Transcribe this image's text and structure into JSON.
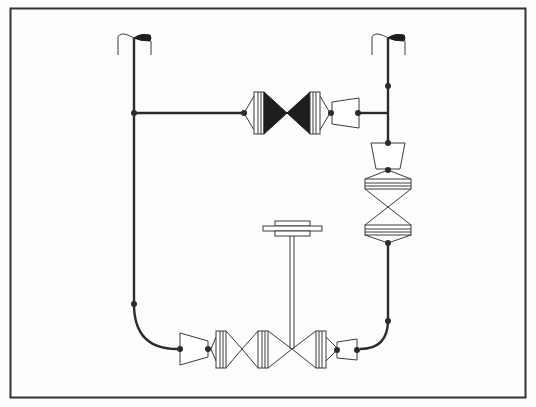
{
  "diagram": {
    "title": "",
    "type": "mechanical schematic",
    "colors": {
      "line": "#2b2b2b",
      "fill": "#ffffff",
      "solid": "#1e1e1e",
      "frame": "#333333"
    },
    "frame": {
      "x": 10,
      "y": 8,
      "w": 516,
      "h": 390
    },
    "vents": [
      {
        "id": "vent-left",
        "x": 133,
        "y": 38
      },
      {
        "id": "vent-right",
        "x": 388,
        "y": 38
      }
    ],
    "components": [
      {
        "id": "upper-valve-pair",
        "kind": "double cone valve (filled)",
        "cx": 274,
        "cy": 113
      },
      {
        "id": "upper-reducer",
        "kind": "reducer",
        "cx": 342,
        "cy": 113
      },
      {
        "id": "right-reducer",
        "kind": "reducer (vertical)",
        "cx": 388,
        "cy": 157
      },
      {
        "id": "right-valve-pair",
        "kind": "double cone valve (vertical, open)",
        "cx": 388,
        "cy": 207
      },
      {
        "id": "stem-handle",
        "kind": "T handle",
        "cx": 289,
        "cy": 228
      },
      {
        "id": "lower-left-reducer",
        "kind": "reducer",
        "cx": 194,
        "cy": 349
      },
      {
        "id": "lower-valve-chain",
        "kind": "triple cone valve assembly",
        "cx": 290,
        "cy": 349
      },
      {
        "id": "lower-right-reducer",
        "kind": "reducer",
        "cx": 351,
        "cy": 349
      }
    ],
    "nodes": [
      [
        133,
        113
      ],
      [
        244,
        113
      ],
      [
        330,
        113
      ],
      [
        358,
        113
      ],
      [
        388,
        99
      ],
      [
        388,
        113
      ],
      [
        388,
        143
      ],
      [
        388,
        171
      ],
      [
        388,
        243
      ],
      [
        388,
        320
      ],
      [
        133,
        304
      ],
      [
        177,
        349
      ],
      [
        211,
        349
      ],
      [
        338,
        349
      ],
      [
        360,
        349
      ]
    ]
  }
}
